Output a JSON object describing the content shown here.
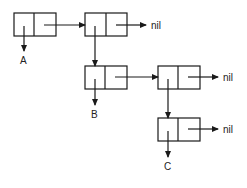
{
  "diagram": {
    "type": "cons-cell list structure",
    "line_color": "#1a1a1a",
    "cells": [
      {
        "id": "c1",
        "x": 14,
        "y": 13,
        "car": "A",
        "cdr": "c2"
      },
      {
        "id": "c2",
        "x": 85,
        "y": 13,
        "car": "c3",
        "cdr": "nil"
      },
      {
        "id": "c3",
        "x": 85,
        "y": 66,
        "car": "B",
        "cdr": "c4"
      },
      {
        "id": "c4",
        "x": 158,
        "y": 66,
        "car": "c5",
        "cdr": "nil"
      },
      {
        "id": "c5",
        "x": 158,
        "y": 118,
        "car": "C",
        "cdr": "nil"
      }
    ],
    "labels": {
      "a": "A",
      "b": "B",
      "c": "C",
      "nil1": "nil",
      "nil2": "nil",
      "nil3": "nil"
    }
  }
}
